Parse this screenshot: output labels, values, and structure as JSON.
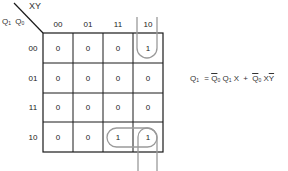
{
  "kmap": {
    "corner_col_label": "XY",
    "corner_row_label_a": "Q",
    "corner_row_label_a_sub": "1",
    "corner_row_label_b": "Q",
    "corner_row_label_b_sub": "0",
    "col_headers": [
      "00",
      "01",
      "11",
      "10"
    ],
    "row_headers": [
      "00",
      "01",
      "11",
      "10"
    ],
    "cells": [
      [
        "0",
        "0",
        "0",
        "1"
      ],
      [
        "0",
        "0",
        "0",
        "0"
      ],
      [
        "0",
        "0",
        "0",
        "0"
      ],
      [
        "0",
        "0",
        "1",
        "1"
      ]
    ],
    "grid_color": "#1a1a1a",
    "loop_color": "#999999"
  },
  "equation": {
    "lhs": "Q",
    "lhs_sub": "1",
    "equals": "=",
    "term1_a": "Q",
    "term1_a_sub": "0",
    "term1_b": "Q",
    "term1_b_sub": "1",
    "term1_c": "X",
    "plus": "+",
    "term2_a": "Q",
    "term2_a_sub": "0",
    "term2_b": "X",
    "term2_c": "Y"
  }
}
